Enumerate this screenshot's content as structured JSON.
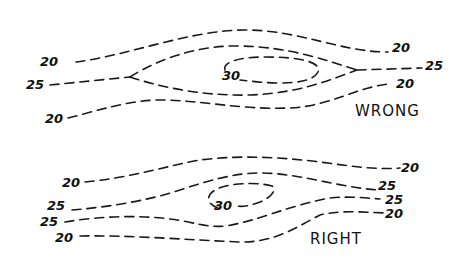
{
  "diagram": {
    "panels": [
      {
        "caption": "WRONG",
        "labels": {
          "top_left_20": "20",
          "top_right_20": "20",
          "left_25": "25",
          "right_25": "25",
          "bottom_left_20": "20",
          "bottom_right_20": "20",
          "center_30": "30"
        }
      },
      {
        "caption": "RIGHT",
        "labels": {
          "top_left_20": "20",
          "top_right_20": "20",
          "upper_left_25": "25",
          "upper_right_25": "25",
          "lower_left_25": "25",
          "lower_right_25": "25",
          "bottom_left_20": "20",
          "bottom_right_20": "20",
          "center_30": "30"
        }
      }
    ],
    "colors": {
      "ink": "#1a1a1a",
      "background": "#ffffff"
    }
  }
}
